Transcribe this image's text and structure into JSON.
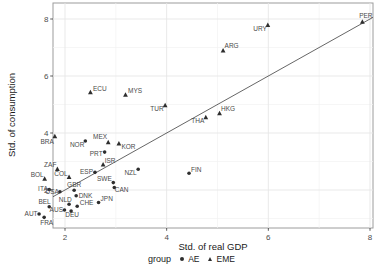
{
  "colors": {
    "background": "#ffffff",
    "panel_bg": "#ffffff",
    "panel_border": "#9c9c9c",
    "grid_major": "#e6e6e6",
    "grid_minor": "#f2f2f2",
    "tick_mark": "#333333",
    "tick_text": "#4d4d4d",
    "axis_title_text": "#1a1a1a",
    "point": "#2e2e2e",
    "point_label": "#4a4a4a",
    "reference_line": "#3f3f3f"
  },
  "chart_data": {
    "type": "scatter",
    "title": "",
    "xlabel": "Std. of real GDP",
    "ylabel": "Std. of consumption",
    "xlim": [
      1.76,
      8.06
    ],
    "ylim": [
      0.67,
      8.56
    ],
    "grid": true,
    "x_ticks": [
      2,
      4,
      6,
      8
    ],
    "y_ticks": [
      2,
      4,
      6,
      8
    ],
    "x_tick_labels": [
      "2",
      "4",
      "6",
      "8"
    ],
    "y_tick_labels": [
      "2",
      "4",
      "6",
      "8"
    ],
    "x_minor_ticks": [
      3,
      5,
      7
    ],
    "y_minor_ticks": [
      1,
      3,
      5,
      7
    ],
    "reference_line": {
      "description": "45-degree identity line y = x"
    },
    "legend": {
      "position": "bottom",
      "title": "group",
      "items": [
        {
          "label": "AE",
          "marker": "circle"
        },
        {
          "label": "EME",
          "marker": "triangle"
        }
      ]
    },
    "series": [
      {
        "name": "AE",
        "marker": "circle",
        "points": [
          {
            "label": "NOR",
            "x": 2.4,
            "y": 3.72,
            "lx": -1,
            "ly": 6,
            "anchor": "end"
          },
          {
            "label": "PRT",
            "x": 2.78,
            "y": 3.33,
            "lx": -2,
            "ly": 3.5,
            "anchor": "end"
          },
          {
            "label": "ESP",
            "x": 2.59,
            "y": 2.62,
            "lx": -2,
            "ly": 2,
            "anchor": "end"
          },
          {
            "label": "NZL",
            "x": 3.44,
            "y": 2.73,
            "lx": -1.5,
            "ly": 6,
            "anchor": "end"
          },
          {
            "label": "FIN",
            "x": 4.44,
            "y": 2.59,
            "lx": 2,
            "ly": -1.5,
            "anchor": "start"
          },
          {
            "label": "SWE",
            "x": 2.95,
            "y": 2.26,
            "lx": -1.5,
            "ly": -1.5,
            "anchor": "end"
          },
          {
            "label": "CAN",
            "x": 2.97,
            "y": 2.09,
            "lx": 0.5,
            "ly": 4.5,
            "anchor": "start"
          },
          {
            "label": "ITA",
            "x": 1.69,
            "y": 2.02,
            "lx": -1.5,
            "ly": 2,
            "anchor": "end"
          },
          {
            "label": "USA",
            "x": 1.9,
            "y": 1.94,
            "lx": -1,
            "ly": 2.5,
            "anchor": "end"
          },
          {
            "label": "GBR",
            "x": 2.18,
            "y": 1.99,
            "lx": 0,
            "ly": -3.5,
            "anchor": "middle"
          },
          {
            "label": "DNK",
            "x": 2.22,
            "y": 1.8,
            "lx": 2.5,
            "ly": 2,
            "anchor": "start"
          },
          {
            "label": "NLD",
            "x": 2.08,
            "y": 1.5,
            "lx": 2.7,
            "ly": -2.5,
            "anchor": "end"
          },
          {
            "label": "BEL",
            "x": 1.69,
            "y": 1.41,
            "lx": 1.5,
            "ly": -2.5,
            "anchor": "end"
          },
          {
            "label": "CHE",
            "x": 2.24,
            "y": 1.43,
            "lx": 2.5,
            "ly": -1.5,
            "anchor": "start"
          },
          {
            "label": "JPN",
            "x": 2.66,
            "y": 1.56,
            "lx": 2,
            "ly": -1.5,
            "anchor": "start"
          },
          {
            "label": "AUS",
            "x": 1.99,
            "y": 1.3,
            "lx": -1.5,
            "ly": 2.5,
            "anchor": "end"
          },
          {
            "label": "DEU",
            "x": 2.12,
            "y": 1.26,
            "lx": 1,
            "ly": 6,
            "anchor": "middle"
          },
          {
            "label": "AUT",
            "x": 1.49,
            "y": 1.16,
            "lx": -1.5,
            "ly": 2.5,
            "anchor": "end"
          },
          {
            "label": "FRA",
            "x": 1.59,
            "y": 1.04,
            "lx": -4,
            "ly": 7.5,
            "anchor": "start"
          }
        ]
      },
      {
        "name": "EME",
        "marker": "triangle",
        "points": [
          {
            "label": "PER",
            "x": 7.85,
            "y": 7.9,
            "lx": 3.5,
            "ly": -3.5,
            "anchor": "middle"
          },
          {
            "label": "URY",
            "x": 5.99,
            "y": 7.79,
            "lx": -1,
            "ly": 6.5,
            "anchor": "end"
          },
          {
            "label": "ARG",
            "x": 5.11,
            "y": 6.89,
            "lx": 1.5,
            "ly": -2.5,
            "anchor": "start"
          },
          {
            "label": "ECU",
            "x": 2.5,
            "y": 5.43,
            "lx": 2.5,
            "ly": -1.5,
            "anchor": "start"
          },
          {
            "label": "MYS",
            "x": 3.19,
            "y": 5.34,
            "lx": 2.5,
            "ly": -1.5,
            "anchor": "start"
          },
          {
            "label": "TUR",
            "x": 3.97,
            "y": 4.97,
            "lx": -1.5,
            "ly": 6,
            "anchor": "end"
          },
          {
            "label": "HKG",
            "x": 5.04,
            "y": 4.69,
            "lx": 1.5,
            "ly": -2,
            "anchor": "start"
          },
          {
            "label": "THA",
            "x": 4.77,
            "y": 4.55,
            "lx": -1.5,
            "ly": 5.5,
            "anchor": "end"
          },
          {
            "label": "MEX",
            "x": 2.85,
            "y": 3.67,
            "lx": -1,
            "ly": -3.5,
            "anchor": "end"
          },
          {
            "label": "KOR",
            "x": 3.06,
            "y": 3.63,
            "lx": 2.5,
            "ly": 5,
            "anchor": "start"
          },
          {
            "label": "BRA",
            "x": 1.8,
            "y": 3.88,
            "lx": -1,
            "ly": 7.5,
            "anchor": "end"
          },
          {
            "label": "ZAF",
            "x": 1.85,
            "y": 2.73,
            "lx": -1,
            "ly": -2.5,
            "anchor": "end"
          },
          {
            "label": "BOL",
            "x": 1.6,
            "y": 2.39,
            "lx": -1,
            "ly": -1.5,
            "anchor": "end"
          },
          {
            "label": "COL",
            "x": 2.08,
            "y": 2.45,
            "lx": -1.5,
            "ly": -1.5,
            "anchor": "end"
          },
          {
            "label": "ISR",
            "x": 2.75,
            "y": 2.89,
            "lx": 1.5,
            "ly": -2,
            "anchor": "start"
          }
        ]
      }
    ]
  }
}
